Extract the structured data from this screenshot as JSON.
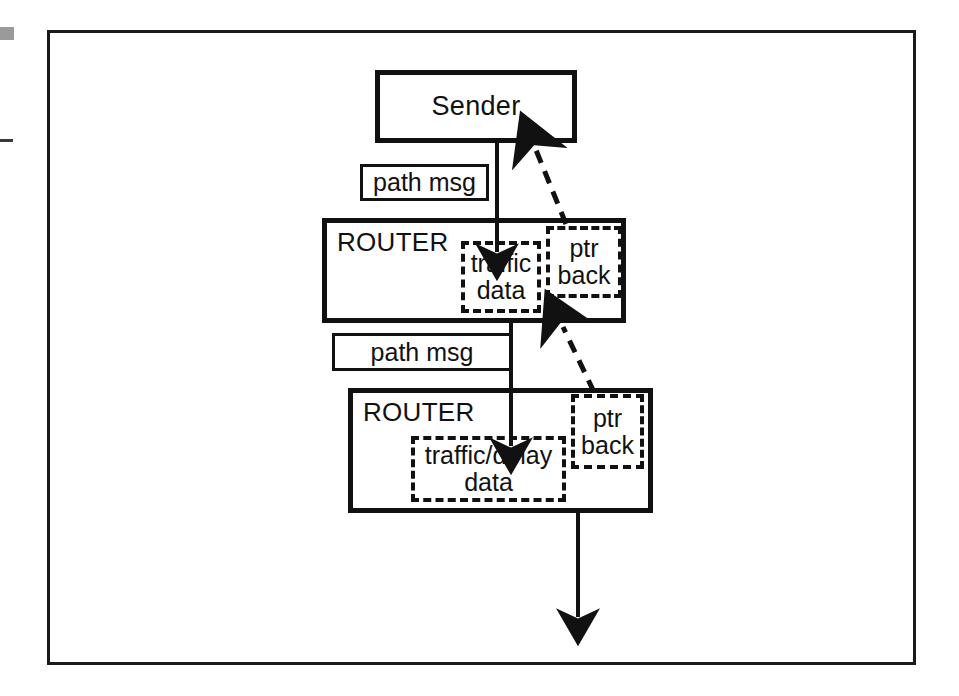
{
  "diagram": {
    "background": "#ffffff",
    "ink": "#111111",
    "nodes": {
      "sender": {
        "label": "Sender"
      },
      "router_1": {
        "label": "ROUTER",
        "traffic_store": "traffic\ndata",
        "pointer_store": "ptr\nback"
      },
      "router_2": {
        "label": "ROUTER",
        "traffic_store": "traffic/delay\ndata",
        "pointer_store": "ptr\nback"
      }
    },
    "edge_labels": {
      "path_msg_1": "path msg",
      "path_msg_2": "path msg"
    },
    "arrows": [
      {
        "name": "sender-to-router1",
        "style": "solid",
        "direction": "down"
      },
      {
        "name": "router1-to-router2",
        "style": "solid",
        "direction": "down"
      },
      {
        "name": "router2-downstream",
        "style": "solid",
        "direction": "down"
      },
      {
        "name": "router1-ptr-back-to-sender",
        "style": "dashed",
        "direction": "up-left"
      },
      {
        "name": "router2-ptr-back-to-router1",
        "style": "dashed",
        "direction": "up-left"
      }
    ]
  }
}
